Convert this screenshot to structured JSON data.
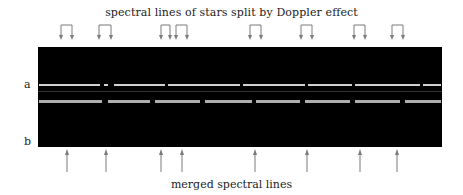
{
  "title": "spectral lines of stars split by Doppler effect",
  "footer": "merged spectral lines",
  "labels": {
    "a": "a",
    "b": "b"
  },
  "colors": {
    "band": "#000000",
    "arrow": "#7a7a7a",
    "line": "#e8e8e8"
  },
  "split_pairs": [
    [
      61,
      72
    ],
    [
      99,
      111
    ],
    [
      161,
      170
    ],
    [
      176,
      187
    ],
    [
      250,
      261
    ],
    [
      301,
      312
    ],
    [
      354,
      365
    ],
    [
      392,
      403
    ]
  ],
  "merged_positions": [
    67,
    106,
    161,
    182,
    255,
    307,
    360,
    397
  ],
  "spectrum_a": [
    [
      39,
      100
    ],
    [
      104,
      108
    ],
    [
      114,
      165
    ],
    [
      168,
      240
    ],
    [
      243,
      305
    ],
    [
      308,
      352
    ],
    [
      355,
      420
    ],
    [
      423,
      441
    ]
  ],
  "spectrum_b": [
    [
      39,
      102
    ],
    [
      108,
      150
    ],
    [
      155,
      200
    ],
    [
      205,
      252
    ],
    [
      256,
      300
    ],
    [
      305,
      350
    ],
    [
      355,
      400
    ],
    [
      405,
      441
    ]
  ]
}
